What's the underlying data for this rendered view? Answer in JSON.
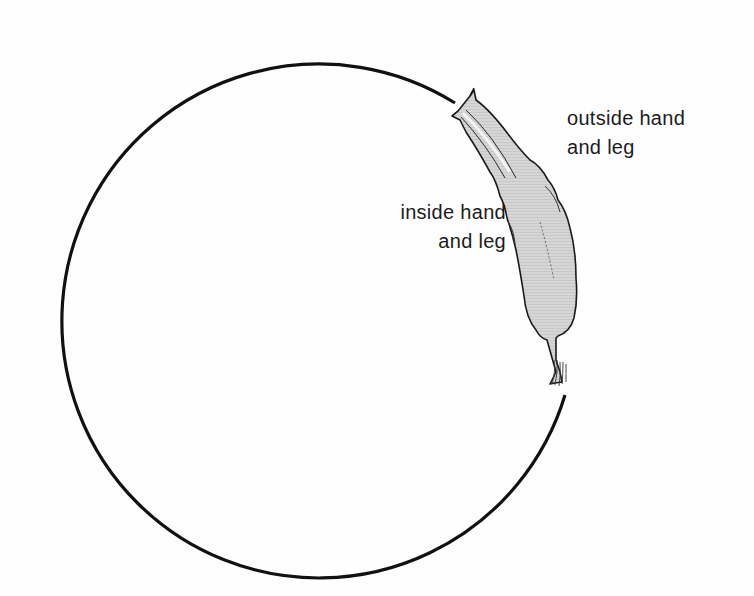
{
  "diagram": {
    "type": "illustration",
    "circle": {
      "center": [
        310,
        319
      ],
      "radius": 257,
      "stroke": "#111111",
      "gap_note": "circle path interrupted where the figure is positioned on the upper-right"
    },
    "figure": {
      "fill": "#d4d4d4",
      "outline": "#1a1a1a",
      "direction": "head toward top-left along circle, tail/hair toward bottom"
    },
    "labels": {
      "outside": {
        "line1": "outside hand",
        "line2": "and leg"
      },
      "inside": {
        "line1": "inside hand",
        "line2": "and leg"
      }
    }
  }
}
